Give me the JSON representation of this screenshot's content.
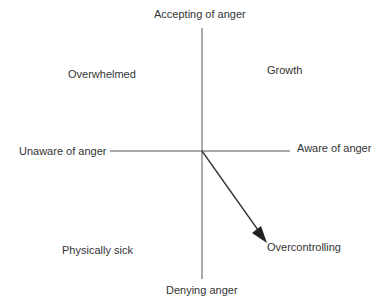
{
  "diagram": {
    "type": "quadrant",
    "axes": {
      "vertical_top": "Accepting of anger",
      "vertical_bottom": "Denying anger",
      "horizontal_left": "Unaware of anger",
      "horizontal_right": "Aware of anger"
    },
    "quadrants": {
      "top_left": "Overwhelmed",
      "top_right": "Growth",
      "bottom_left": "Physically sick",
      "bottom_right": "Overcontrolling"
    },
    "arrow": {
      "from": "origin",
      "to": "Overcontrolling"
    },
    "colors": {
      "line": "#444444",
      "text": "#333333"
    }
  }
}
